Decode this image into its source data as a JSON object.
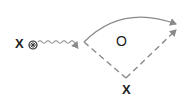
{
  "diagram": {
    "type": "feynman-like",
    "labels": {
      "source": "X",
      "loop": "O",
      "bottom": "X"
    },
    "icons": {
      "source_marker": "circled-cross-icon"
    },
    "edges": [
      {
        "from": "source",
        "to": "vertex",
        "style": "wavy",
        "arrow": true
      },
      {
        "from": "vertex",
        "to": "out",
        "style": "solid-curve",
        "arrow": true
      },
      {
        "from": "vertex",
        "to": "bottom",
        "style": "dashed",
        "arrow": false
      },
      {
        "from": "bottom",
        "to": "out",
        "style": "dashed",
        "arrow": true
      }
    ],
    "colors": {
      "line": "#8a8a8a",
      "text": "#222222",
      "background": "#ffffff"
    }
  }
}
